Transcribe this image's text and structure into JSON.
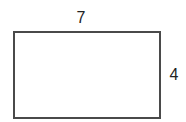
{
  "diagram": {
    "shape": "rectangle",
    "stroke_color": "#4a4a4a",
    "fill_color": "#ffffff",
    "labels": {
      "top": "7",
      "right": "4"
    },
    "dimensions": {
      "width": "7",
      "height": "4"
    }
  }
}
